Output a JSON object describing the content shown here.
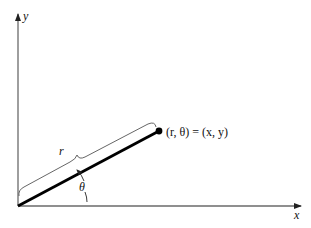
{
  "diagram": {
    "axes": {
      "x_label": "x",
      "y_label": "y"
    },
    "labels": {
      "point": "(r, θ) = (x, y)",
      "radius": "r",
      "angle": "θ"
    },
    "colors": {
      "axis": "#6a6a6a",
      "ray": "#000000",
      "brace": "#555555",
      "text": "#111111"
    }
  }
}
